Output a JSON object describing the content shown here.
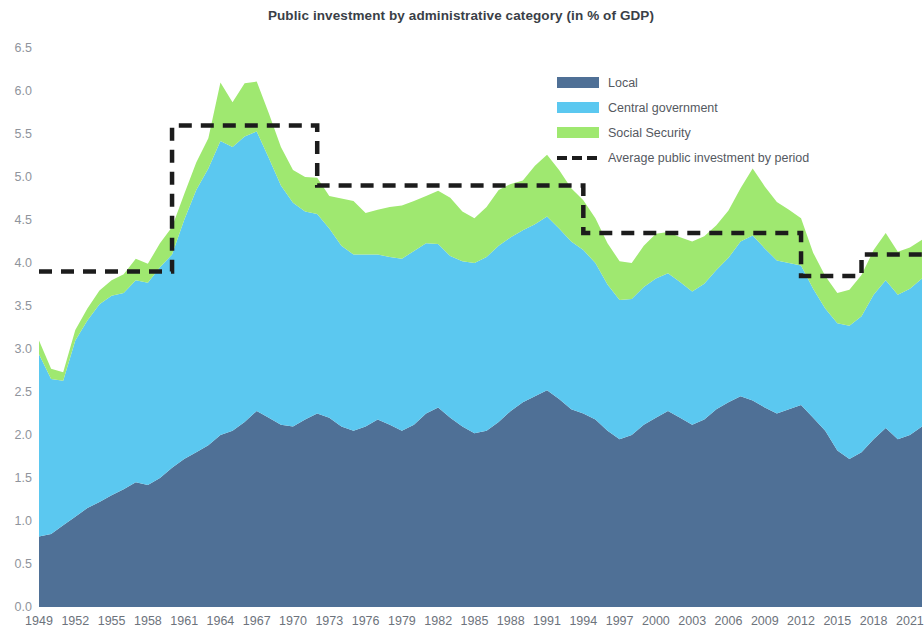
{
  "chart_data": {
    "type": "area",
    "title": "Public investment by administrative category (in % of GDP)",
    "subtitle": "",
    "xlabel": "",
    "ylabel": "",
    "stacked": true,
    "grid": false,
    "legend_position": "top-right",
    "xlim": [
      1949,
      2022
    ],
    "ylim": [
      0.0,
      6.5
    ],
    "y_ticks": [
      "0.0",
      "0.5",
      "1.0",
      "1.5",
      "2.0",
      "2.5",
      "3.0",
      "3.5",
      "4.0",
      "4.5",
      "5.0",
      "5.5",
      "6.0",
      "6.5"
    ],
    "x_ticks": [
      "1949",
      "1952",
      "1955",
      "1958",
      "1961",
      "1964",
      "1967",
      "1970",
      "1973",
      "1976",
      "1979",
      "1982",
      "1985",
      "1988",
      "1991",
      "1994",
      "1997",
      "2000",
      "2003",
      "2006",
      "2009",
      "2012",
      "2015",
      "2018",
      "2021"
    ],
    "x": [
      1949,
      1950,
      1951,
      1952,
      1953,
      1954,
      1955,
      1956,
      1957,
      1958,
      1959,
      1960,
      1961,
      1962,
      1963,
      1964,
      1965,
      1966,
      1967,
      1968,
      1969,
      1970,
      1971,
      1972,
      1973,
      1974,
      1975,
      1976,
      1977,
      1978,
      1979,
      1980,
      1981,
      1982,
      1983,
      1984,
      1985,
      1986,
      1987,
      1988,
      1989,
      1990,
      1991,
      1992,
      1993,
      1994,
      1995,
      1996,
      1997,
      1998,
      1999,
      2000,
      2001,
      2002,
      2003,
      2004,
      2005,
      2006,
      2007,
      2008,
      2009,
      2010,
      2011,
      2012,
      2013,
      2014,
      2015,
      2016,
      2017,
      2018,
      2019,
      2020,
      2021,
      2022
    ],
    "series": [
      {
        "name": "Local",
        "color": "#4F7096",
        "values": [
          0.82,
          0.85,
          0.95,
          1.05,
          1.15,
          1.22,
          1.3,
          1.37,
          1.45,
          1.42,
          1.5,
          1.62,
          1.72,
          1.8,
          1.88,
          2.0,
          2.05,
          2.15,
          2.28,
          2.2,
          2.12,
          2.1,
          2.18,
          2.25,
          2.2,
          2.1,
          2.05,
          2.1,
          2.18,
          2.12,
          2.05,
          2.12,
          2.25,
          2.32,
          2.2,
          2.1,
          2.02,
          2.05,
          2.15,
          2.28,
          2.38,
          2.45,
          2.52,
          2.42,
          2.3,
          2.25,
          2.18,
          2.05,
          1.95,
          2.0,
          2.12,
          2.2,
          2.28,
          2.2,
          2.12,
          2.18,
          2.3,
          2.38,
          2.45,
          2.4,
          2.32,
          2.25,
          2.3,
          2.35,
          2.2,
          2.05,
          1.82,
          1.72,
          1.8,
          1.95,
          2.08,
          1.95,
          2.0,
          2.1
        ]
      },
      {
        "name": "Central government",
        "color": "#5BC8F0",
        "values": [
          2.12,
          1.8,
          1.68,
          2.05,
          2.18,
          2.3,
          2.32,
          2.28,
          2.35,
          2.35,
          2.45,
          2.48,
          2.78,
          3.05,
          3.22,
          3.42,
          3.3,
          3.32,
          3.25,
          3.02,
          2.78,
          2.6,
          2.42,
          2.32,
          2.2,
          2.1,
          2.05,
          2.0,
          1.92,
          1.95,
          2.0,
          2.02,
          1.98,
          1.9,
          1.88,
          1.92,
          1.98,
          2.02,
          2.05,
          2.02,
          2.0,
          2.0,
          2.02,
          1.98,
          1.95,
          1.9,
          1.82,
          1.7,
          1.62,
          1.58,
          1.6,
          1.62,
          1.6,
          1.58,
          1.55,
          1.58,
          1.62,
          1.68,
          1.8,
          1.92,
          1.85,
          1.78,
          1.7,
          1.62,
          1.5,
          1.42,
          1.48,
          1.55,
          1.58,
          1.68,
          1.72,
          1.68,
          1.7,
          1.72
        ]
      },
      {
        "name": "Social Security",
        "color": "#9FE870",
        "values": [
          0.16,
          0.12,
          0.1,
          0.12,
          0.14,
          0.16,
          0.18,
          0.22,
          0.25,
          0.22,
          0.28,
          0.32,
          0.3,
          0.32,
          0.35,
          0.68,
          0.52,
          0.62,
          0.58,
          0.52,
          0.45,
          0.38,
          0.4,
          0.42,
          0.38,
          0.55,
          0.62,
          0.48,
          0.52,
          0.58,
          0.62,
          0.58,
          0.55,
          0.62,
          0.68,
          0.58,
          0.52,
          0.58,
          0.65,
          0.62,
          0.58,
          0.68,
          0.72,
          0.68,
          0.62,
          0.58,
          0.52,
          0.48,
          0.45,
          0.42,
          0.48,
          0.52,
          0.48,
          0.52,
          0.58,
          0.55,
          0.52,
          0.55,
          0.62,
          0.78,
          0.72,
          0.68,
          0.62,
          0.55,
          0.42,
          0.38,
          0.35,
          0.42,
          0.48,
          0.52,
          0.55,
          0.5,
          0.48,
          0.45
        ]
      }
    ],
    "average_line": {
      "name": "Average public investment by period",
      "color": "#1c1c1c",
      "style": "dashed",
      "segments": [
        {
          "start": 1949,
          "end": 1960,
          "value": 3.9
        },
        {
          "start": 1961,
          "end": 1972,
          "value": 5.6
        },
        {
          "start": 1973,
          "end": 1994,
          "value": 4.9
        },
        {
          "start": 1995,
          "end": 2012,
          "value": 4.35
        },
        {
          "start": 2013,
          "end": 2017,
          "value": 3.85
        },
        {
          "start": 2018,
          "end": 2022,
          "value": 4.1
        }
      ]
    }
  },
  "legend": {
    "items": [
      {
        "label": "Local",
        "color": "#4F7096",
        "kind": "swatch"
      },
      {
        "label": "Central government",
        "color": "#5BC8F0",
        "kind": "swatch"
      },
      {
        "label": "Social Security",
        "color": "#9FE870",
        "kind": "swatch"
      },
      {
        "label": "Average public investment by period",
        "color": "#1c1c1c",
        "kind": "dash"
      }
    ]
  }
}
